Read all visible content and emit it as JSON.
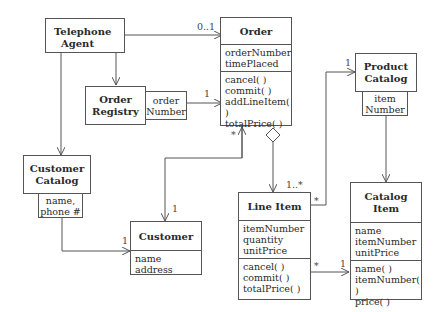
{
  "classes": {
    "telephone_agent": {
      "title_line1": "Telephone",
      "title_line2": "Agent",
      "stereotype_icon": "actor-stick-figure"
    },
    "order": {
      "title": "Order",
      "attributes": [
        "orderNumber",
        "timePlaced"
      ],
      "operations": [
        "cancel( )",
        "commit( )",
        "addLineItem( )",
        "totalPrice( )"
      ]
    },
    "order_registry": {
      "title_line1": "Order",
      "title_line2": "Registry",
      "qualifier_line1": "order",
      "qualifier_line2": "Number"
    },
    "product_catalog": {
      "title_line1": "Product",
      "title_line2": "Catalog",
      "qualifier_line1": "item",
      "qualifier_line2": "Number"
    },
    "customer_catalog": {
      "title_line1": "Customer",
      "title_line2": "Catalog",
      "qualifier_line1": "name,",
      "qualifier_line2": "phone #"
    },
    "customer": {
      "title": "Customer",
      "attributes": [
        "name",
        "address"
      ]
    },
    "line_item": {
      "title": "Line Item",
      "attributes": [
        "itemNumber",
        "quantity",
        "unitPrice"
      ],
      "operations": [
        "cancel( )",
        "commit( )",
        "totalPrice( )"
      ]
    },
    "catalog_item": {
      "title_line1": "Catalog",
      "title_line2": "Item",
      "attributes": [
        "name",
        "itemNumber",
        "unitPrice"
      ],
      "operations": [
        "name( )",
        "itemNumber( )",
        "price( )"
      ]
    }
  },
  "multiplicities": {
    "agent_order": "0..1",
    "registry_order": "1",
    "order_customer_order_end": "*",
    "order_customer_customer_end": "1",
    "order_lineitem": "1..*",
    "lineitem_product_lineitem_end": "*",
    "lineitem_product_product_end": "1",
    "custcatalog_customer": "1",
    "lineitem_catalogitem_lineitem_end": "*",
    "lineitem_catalogitem_catalogitem_end": "1"
  }
}
